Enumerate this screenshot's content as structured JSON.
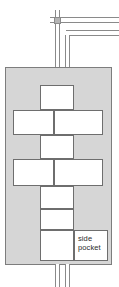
{
  "diagram": {
    "colors": {
      "vessel_fill": "#d6d6d6",
      "vessel_stroke": "#7d7d7d",
      "cell_fill": "#ffffff",
      "cell_stroke": "#6e6e6e",
      "pipe_stroke": "#8a8a8a",
      "junction_fill": "#b4b4b4",
      "background": "#ffffff",
      "text": "#2b2b2b"
    },
    "labels": {
      "side_pocket": "side\npocket"
    },
    "cells": [
      {
        "name": "cell-top-center",
        "x": 40,
        "y": 85,
        "w": 34,
        "h": 24
      },
      {
        "name": "cell-row1-left",
        "x": 13,
        "y": 109,
        "w": 41,
        "h": 25
      },
      {
        "name": "cell-row1-right",
        "x": 54,
        "y": 109,
        "w": 49,
        "h": 25
      },
      {
        "name": "cell-mid-center",
        "x": 40,
        "y": 134,
        "w": 34,
        "h": 24
      },
      {
        "name": "cell-row2-left",
        "x": 13,
        "y": 158,
        "w": 41,
        "h": 27
      },
      {
        "name": "cell-row2-right",
        "x": 54,
        "y": 158,
        "w": 49,
        "h": 27
      },
      {
        "name": "cell-lower-center-1",
        "x": 40,
        "y": 185,
        "w": 34,
        "h": 23
      },
      {
        "name": "cell-lower-center-2",
        "x": 40,
        "y": 208,
        "w": 34,
        "h": 21
      },
      {
        "name": "cell-bottom-center",
        "x": 40,
        "y": 229,
        "w": 34,
        "h": 31
      }
    ],
    "side_pocket_cell": {
      "name": "cell-side-pocket",
      "x": 74,
      "y": 229,
      "w": 34,
      "h": 31
    },
    "vessel_rect": {
      "x": 5,
      "y": 67,
      "w": 107,
      "h": 198
    },
    "pipes": {
      "top_vertical_left": {
        "x": 55,
        "y": 25,
        "w": 5,
        "h": 42
      },
      "top_vertical_right": {
        "x": 65,
        "y": 33,
        "w": 5,
        "h": 34
      },
      "top_stub_above": {
        "x": 55,
        "y": 10,
        "w": 5,
        "h": 10
      },
      "top_horizontal_upper": {
        "x": 50,
        "y": 18,
        "w": 69,
        "h": 5
      },
      "top_horizontal_lower": {
        "x": 68,
        "y": 31,
        "w": 51,
        "h": 5
      },
      "junction": {
        "x": 54,
        "y": 17,
        "w": 7,
        "h": 7
      },
      "bottom_vertical_left": {
        "x": 55,
        "y": 265,
        "w": 5,
        "h": 22
      },
      "bottom_vertical_right": {
        "x": 65,
        "y": 265,
        "w": 5,
        "h": 22
      }
    }
  }
}
